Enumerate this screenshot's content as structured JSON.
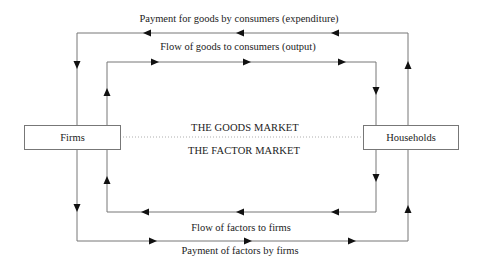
{
  "diagram": {
    "nodes": {
      "firms": "Firms",
      "households": "Households"
    },
    "markets": {
      "goods": "THE GOODS MARKET",
      "factor": "THE FACTOR MARKET"
    },
    "flows": {
      "expenditure": "Payment for goods by consumers (expenditure)",
      "output": "Flow of goods to consumers (output)",
      "factors": "Flow of factors to firms",
      "factor_payment": "Payment of factors by firms"
    },
    "edges": [
      {
        "from": "households",
        "to": "firms",
        "label_ref": "flows.expenditure",
        "direction": "left",
        "loop": "outer-top"
      },
      {
        "from": "firms",
        "to": "households",
        "label_ref": "flows.output",
        "direction": "right",
        "loop": "inner-top"
      },
      {
        "from": "households",
        "to": "firms",
        "label_ref": "flows.factors",
        "direction": "left",
        "loop": "inner-bottom"
      },
      {
        "from": "firms",
        "to": "households",
        "label_ref": "flows.factor_payment",
        "direction": "right",
        "loop": "outer-bottom"
      }
    ],
    "colors": {
      "line": "#777777",
      "arrow": "#111111",
      "text": "#222222",
      "divider": "#999999"
    }
  }
}
